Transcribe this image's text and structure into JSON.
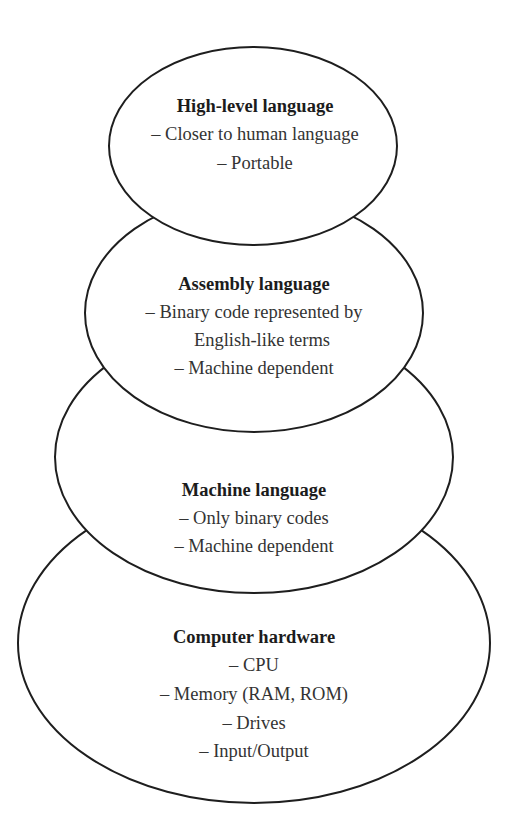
{
  "diagram": {
    "type": "stacked-ellipses-hierarchy",
    "layers": [
      {
        "title": "High-level language",
        "lines": [
          "– Closer to human language",
          "– Portable"
        ]
      },
      {
        "title": "Assembly language",
        "lines": [
          "– Binary code represented by",
          "English-like terms",
          "– Machine dependent"
        ]
      },
      {
        "title": "Machine language",
        "lines": [
          "– Only binary codes",
          "– Machine dependent"
        ]
      },
      {
        "title": "Computer hardware",
        "lines": [
          "– CPU",
          "– Memory (RAM, ROM)",
          "– Drives",
          "– Input/Output"
        ]
      }
    ]
  },
  "colors": {
    "stroke": "#1e1e1e",
    "title_text": "#1c1c1c",
    "body_text": "#333333",
    "background": "#ffffff"
  }
}
